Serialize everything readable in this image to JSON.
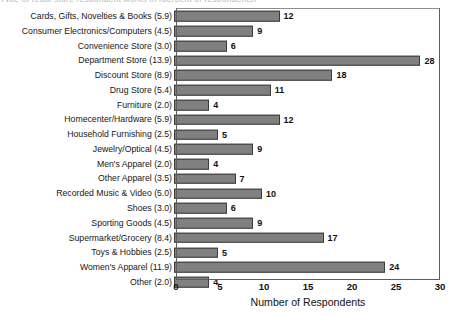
{
  "top_clipped_text": "Type of retail store respondent works in (percent of respondents)",
  "chart_data": {
    "type": "bar",
    "orientation": "horizontal",
    "title": "",
    "xlabel": "Number of Respondents",
    "ylabel": "",
    "xlim": [
      0,
      30
    ],
    "xticks": [
      0,
      5,
      10,
      15,
      20,
      25,
      30
    ],
    "grid": false,
    "legend": null,
    "bar_color": "#808080",
    "bar_edge_color": "#3b3b3b",
    "show_value_labels": true,
    "categories": [
      "Cards, Gifts, Novelties & Books (5.9)",
      "Consumer Electronics/Computers (4.5)",
      "Convenience Store (3.0)",
      "Department Store (13.9)",
      "Discount Store (8.9)",
      "Drug Store (5.4)",
      "Furniture (2.0)",
      "Homecenter/Hardware (5.9)",
      "Household Furnishing (2.5)",
      "Jewelry/Optical (4.5)",
      "Men's Apparel (2.0)",
      "Other Apparel (3.5)",
      "Recorded Music & Video (5.0)",
      "Shoes (3.0)",
      "Sporting Goods (4.5)",
      "Supermarket/Grocery (8.4)",
      "Toys & Hobbies (2.5)",
      "Women's Apparel (11.9)",
      "Other (2.0)"
    ],
    "values": [
      12,
      9,
      6,
      28,
      18,
      11,
      4,
      12,
      5,
      9,
      4,
      7,
      10,
      6,
      9,
      17,
      5,
      24,
      4
    ],
    "category_percentages": [
      5.9,
      4.5,
      3.0,
      13.9,
      8.9,
      5.4,
      2.0,
      5.9,
      2.5,
      4.5,
      2.0,
      3.5,
      5.0,
      3.0,
      4.5,
      8.4,
      2.5,
      11.9,
      2.0
    ]
  }
}
